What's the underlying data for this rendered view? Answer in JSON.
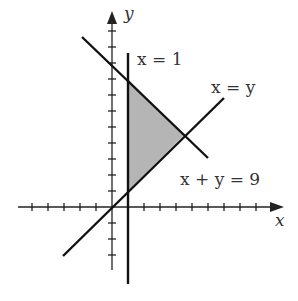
{
  "diagram": {
    "type": "coordinate-region",
    "axes": {
      "x_label": "x",
      "y_label": "y"
    },
    "lines": [
      {
        "id": "vertical",
        "label": "x = 1"
      },
      {
        "id": "diagonal",
        "label": "x = y"
      },
      {
        "id": "antidiagonal",
        "label": "x + y = 9"
      }
    ],
    "region": {
      "description": "shaded triangle bounded by x = 1, x = y, x + y = 9",
      "vertices": [
        [
          1,
          1
        ],
        [
          1,
          8
        ],
        [
          4.5,
          4.5
        ]
      ],
      "fill": "#b5b5b5"
    },
    "colors": {
      "line": "#111111",
      "text": "#333333",
      "shade": "#b5b5b5"
    }
  }
}
